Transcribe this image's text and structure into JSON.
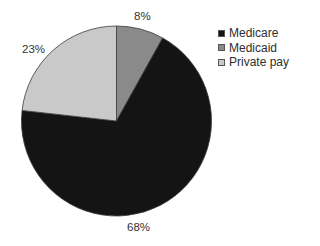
{
  "chart_data": {
    "type": "pie",
    "title": "",
    "categories": [
      "Medicare",
      "Medicaid",
      "Private pay"
    ],
    "values": [
      68,
      8,
      23
    ],
    "unit": "%",
    "labels": [
      "68%",
      "8%",
      "23%"
    ],
    "colors": [
      "#141414",
      "#8a8a8a",
      "#c9c9c9"
    ],
    "start_angle_deg": 0,
    "direction": "clockwise",
    "slice_order_from_top": [
      "Medicaid",
      "Medicare",
      "Private pay"
    ],
    "legend": {
      "position": "top-right",
      "entries": [
        "Medicare",
        "Medicaid",
        "Private pay"
      ]
    }
  },
  "labels": {
    "medicare": "68%",
    "medicaid": "8%",
    "private_pay": "23%"
  },
  "legend": {
    "items": [
      {
        "label": "Medicare",
        "color": "#141414"
      },
      {
        "label": "Medicaid",
        "color": "#8a8a8a"
      },
      {
        "label": "Private pay",
        "color": "#c9c9c9"
      }
    ]
  }
}
